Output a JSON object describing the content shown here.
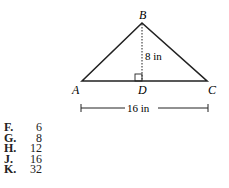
{
  "figure": {
    "vertices": {
      "A": "A",
      "B": "B",
      "C": "C",
      "D": "D"
    },
    "height_label": "8 in",
    "base_label": "16 in"
  },
  "answers": [
    {
      "letter": "F.",
      "value": "6"
    },
    {
      "letter": "G.",
      "value": "8"
    },
    {
      "letter": "H.",
      "value": "12"
    },
    {
      "letter": "J.",
      "value": "16"
    },
    {
      "letter": "K.",
      "value": "32"
    }
  ]
}
